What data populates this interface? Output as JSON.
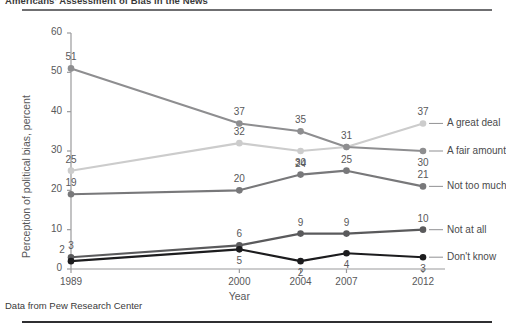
{
  "title": "Americans' Assessment of Bias in the News",
  "source_note": "Data from Pew Research Center",
  "chart_data": {
    "type": "line",
    "title": "Americans' Assessment of Bias in the News",
    "xlabel": "Year",
    "ylabel": "Perception of political bias, percent",
    "x": [
      1989,
      2000,
      2004,
      2007,
      2012
    ],
    "xtick_labels": [
      "1989",
      "2000",
      "2004",
      "2007",
      "2012"
    ],
    "xlim": [
      1989,
      2012
    ],
    "ylim": [
      0,
      60
    ],
    "ytick_labels": [
      "0",
      "10",
      "20",
      "30",
      "40",
      "50",
      "60"
    ],
    "yticks": [
      0,
      10,
      20,
      30,
      40,
      50,
      60
    ],
    "grid": false,
    "legend_position": "right-inline",
    "series": [
      {
        "name": "A great deal",
        "color": "#cccccc",
        "values": [
          25,
          32,
          30,
          31,
          37
        ],
        "labels": [
          "25",
          "32",
          "30",
          "31",
          "37"
        ],
        "end_label": "A great deal",
        "end_value": "37"
      },
      {
        "name": "A fair amount",
        "color": "#8e8e90",
        "values": [
          51,
          37,
          35,
          31,
          30
        ],
        "labels": [
          "51",
          "37",
          "35",
          "31",
          "30"
        ],
        "end_label": "A fair amount",
        "end_value": "30"
      },
      {
        "name": "Not too much",
        "color": "#78787a",
        "values": [
          19,
          20,
          24,
          25,
          21
        ],
        "labels": [
          "19",
          "20",
          "24",
          "25",
          "21"
        ],
        "end_label": "Not too much",
        "end_value": "21"
      },
      {
        "name": "Not at all",
        "color": "#5a5a5c",
        "values": [
          3,
          6,
          9,
          9,
          10
        ],
        "labels": [
          "3",
          "6",
          "9",
          "9",
          "10"
        ],
        "end_label": "Not at all",
        "end_value": "10"
      },
      {
        "name": "Don't know",
        "color": "#1c1c1e",
        "values": [
          2,
          5,
          2,
          4,
          3
        ],
        "labels": [
          "2",
          "5",
          "2",
          "4",
          "3"
        ],
        "end_label": "Don't know",
        "end_value": "3"
      }
    ]
  }
}
